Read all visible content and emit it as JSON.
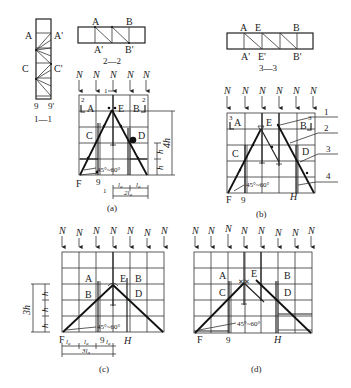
{
  "figure": {
    "sections": {
      "s11": {
        "caption": "1—1",
        "labels": {
          "a": "A",
          "a_prime": "A'",
          "c": "C",
          "c_prime": "C'",
          "nine": "9",
          "nine_prime": "9'"
        }
      },
      "s22": {
        "caption": "2—2",
        "labels": {
          "a": "A",
          "b": "B",
          "a_prime": "A'",
          "b_prime": "B'"
        }
      },
      "s33": {
        "caption": "3—3",
        "labels": {
          "a": "A",
          "e": "E",
          "b": "B",
          "a_prime": "A'",
          "e_prime": "E'",
          "b_prime": "B'"
        }
      }
    },
    "panels": {
      "a": {
        "caption": "(a)",
        "load_label": "N",
        "load_count": 5,
        "labels": {
          "a": "A",
          "b": "B",
          "c": "C",
          "d": "D",
          "e": "E",
          "f": "F",
          "nine": "9",
          "section_mark": "1",
          "section_2": "2"
        },
        "angle": "45°~60°",
        "dims": {
          "h": "h",
          "h4": "4h",
          "la": "l",
          "la_sub": "a",
          "la2": "2l",
          "la2_sub": "a"
        }
      },
      "b": {
        "caption": "(b)",
        "load_label": "N",
        "load_count": 6,
        "labels": {
          "a": "A",
          "b": "B",
          "c": "C",
          "d": "D",
          "e": "E",
          "f": "F",
          "nine": "9",
          "h": "H",
          "section_3": "3"
        },
        "angle": "45°~60°",
        "callouts": [
          "1",
          "2",
          "3",
          "4"
        ]
      },
      "c": {
        "caption": "(c)",
        "load_label": "N",
        "load_count": 7,
        "labels": {
          "a": "A",
          "b1": "B",
          "b2": "B",
          "d": "D",
          "e": "E",
          "f": "F",
          "nine": "9",
          "h": "H"
        },
        "angle": "45°~60°",
        "dims": {
          "h": "h",
          "h3": "3h",
          "la": "l",
          "la_sub": "a",
          "la3": "3l",
          "la3_sub": "a"
        }
      },
      "d": {
        "caption": "(d)",
        "load_label": "N",
        "load_count": 8,
        "labels": {
          "a": "A",
          "b": "B",
          "c": "C",
          "d": "D",
          "e": "E",
          "f": "F",
          "nine": "9",
          "h": "H"
        },
        "angle": "45°~60°"
      }
    }
  }
}
